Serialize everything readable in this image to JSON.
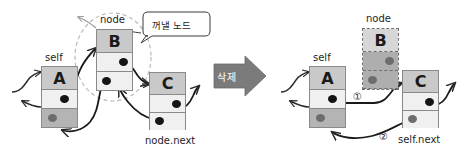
{
  "figure": {
    "type": "linked-list-node-deletion-diagram",
    "transition_label": "삭제",
    "callout": "꺼낼 노드"
  },
  "before": {
    "pointer_labels": {
      "self": "self",
      "node": "node",
      "node_next": "node.next"
    },
    "nodes": [
      {
        "id": "A",
        "value": "A",
        "label": "self",
        "state": "solid"
      },
      {
        "id": "B",
        "value": "B",
        "label": "node",
        "state": "solid"
      },
      {
        "id": "C",
        "value": "C",
        "label": "node.next",
        "state": "solid"
      }
    ]
  },
  "after": {
    "pointer_labels": {
      "self": "self",
      "node": "node",
      "self_next": "self.next"
    },
    "steps": [
      {
        "num": "①",
        "desc": "self.next = node.next"
      },
      {
        "num": "②",
        "desc": "node.next.prev = self"
      }
    ],
    "nodes": [
      {
        "id": "A",
        "value": "A",
        "label": "self",
        "state": "solid"
      },
      {
        "id": "B",
        "value": "B",
        "label": "node",
        "state": "dashed"
      },
      {
        "id": "C",
        "value": "C",
        "label": "self.next",
        "state": "solid"
      }
    ]
  },
  "colors": {
    "head_fill": "#c9c9c9",
    "mid_fill": "#f0f0f0",
    "tail_fill": "#b4b4b4",
    "border": "#8a8a8a",
    "arrow": "#2b2b2b",
    "dashed_guide": "#b9b9b9",
    "delete_arrow_fill": "#7b7b7b",
    "dot": "#141414"
  }
}
